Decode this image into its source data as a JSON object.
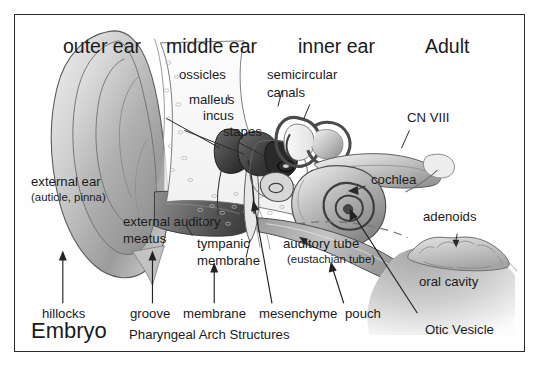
{
  "figure": {
    "title_regions": [
      {
        "id": "outer-ear",
        "label": "outer ear"
      },
      {
        "id": "middle-ear",
        "label": "middle ear"
      },
      {
        "id": "inner-ear",
        "label": "inner ear"
      },
      {
        "id": "adult",
        "label": "Adult"
      },
      {
        "id": "embryo",
        "label": "Embryo"
      }
    ],
    "adult_labels": {
      "ossicles": "ossicles",
      "malleus": "malleus",
      "incus": "incus",
      "stapes": "stapes",
      "semicircular_canals_line1": "semicircular",
      "semicircular_canals_line2": "canals",
      "cn8": "CN VIII",
      "cochlea": "cochlea",
      "external_ear": "external ear",
      "external_ear_sub": "(auticle, pinna)",
      "external_auditory_line1": "external auditory",
      "external_auditory_line2": "meatus",
      "tympanic_line1": "tympanic",
      "tympanic_line2": "membrane",
      "auditory_tube": "auditory tube",
      "auditory_tube_sub": "(eustachian tube)",
      "adenoids": "adenoids",
      "oral_cavity": "oral cavity"
    },
    "embryo_labels": {
      "hillocks": "hillocks",
      "groove": "groove",
      "membrane": "membrane",
      "mesenchyme": "mesenchyme",
      "pouch": "pouch",
      "otic_vesicle": "Otic Vesicle",
      "pharyngeal_arch": "Pharyngeal Arch Structures"
    },
    "colors": {
      "border": "#2b2b2b",
      "background": "#fefefe",
      "text": "#1b1b1b",
      "ink": "#3a3a3a",
      "shade_light": "#dcdcdc",
      "shade_mid": "#aaaaaa",
      "shade_dark": "#6a6a6a",
      "shade_darkest": "#3c3c3c"
    }
  }
}
